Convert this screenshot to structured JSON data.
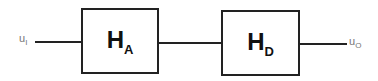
{
  "diagram": {
    "input": {
      "symbol": "u",
      "subscript": "I"
    },
    "output": {
      "symbol": "u",
      "subscript": "O"
    },
    "blocks": [
      {
        "symbol": "H",
        "subscript": "A"
      },
      {
        "symbol": "H",
        "subscript": "D"
      }
    ],
    "line_color": "#222222"
  }
}
